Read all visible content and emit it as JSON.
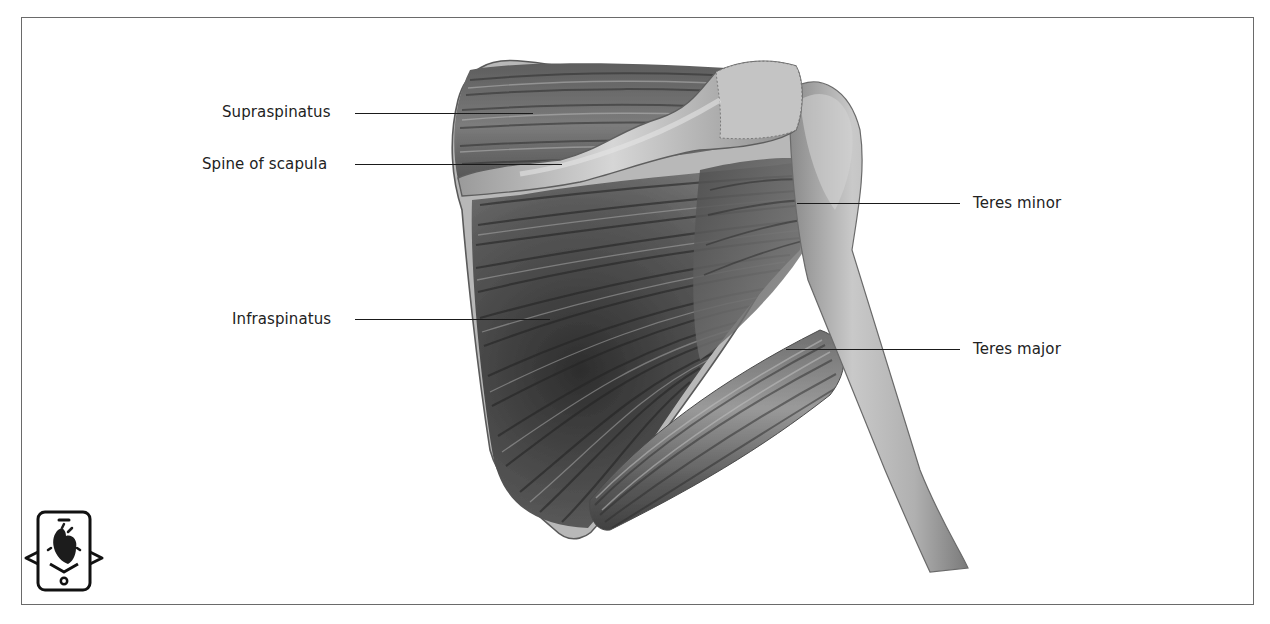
{
  "figure": {
    "type": "anatomical-illustration",
    "colors": {
      "frame": "#6a6a6a",
      "label_text": "#222222",
      "leader_line": "#1a1a1a",
      "muscle_dark": "#3a3a3a",
      "muscle_mid": "#7a7a7a",
      "bone_light": "#c8c8c8"
    }
  },
  "labels": {
    "supraspinatus": "Supraspinatus",
    "spine_of_scapula": "Spine of scapula",
    "infraspinatus": "Infraspinatus",
    "teres_minor": "Teres minor",
    "teres_major": "Teres major"
  },
  "icons": {
    "ar_icon": "augmented-reality-phone-heart-icon"
  },
  "caption": {
    "text": "",
    "note": "caption clipped at bottom edge"
  }
}
